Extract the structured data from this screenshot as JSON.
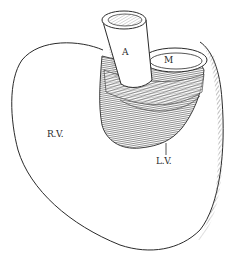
{
  "figure": {
    "labels": {
      "aorta": "A",
      "mitral": "M",
      "right_ventricle": "R.V.",
      "left_ventricle": "L.V."
    },
    "colors": {
      "line": "#2a2a2a",
      "background": "#ffffff",
      "hatch": "#555555"
    }
  }
}
